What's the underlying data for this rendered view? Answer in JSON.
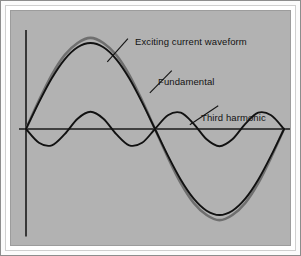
{
  "figure": {
    "background_color": "#b2b2b2",
    "mat_color": "#ffffff",
    "rule_color": "#8d8d8d",
    "curve_color_primary": "#111111",
    "curve_color_secondary": "#6f6f6f",
    "axis_color": "#1a1a1a"
  },
  "labels": {
    "exciting": "Exciting current waveform",
    "fundamental": "Fundamental",
    "third_harmonic": "Third harmonic"
  },
  "chart_data": {
    "type": "line",
    "title": "",
    "xlabel": "",
    "ylabel": "",
    "xlim": [
      0,
      2
    ],
    "ylim": [
      -1.35,
      1.35
    ],
    "grid": false,
    "legend": "annotated-leader-lines",
    "axes": {
      "vertical_axis_x": 0,
      "horizontal_axis_y": 0,
      "vertical_axis_drawn_range": [
        -1.25,
        1.15
      ],
      "horizontal_axis_drawn_range": [
        0,
        2.1
      ]
    },
    "annotations": [
      {
        "text": "Exciting current waveform",
        "target_series": "Exciting current waveform",
        "leader_from": [
          0.63,
          0.78
        ],
        "leader_to": [
          0.79,
          1.05
        ]
      },
      {
        "text": "Fundamental",
        "target_series": "Fundamental",
        "leader_from": [
          0.96,
          0.42
        ],
        "leader_to": [
          1.13,
          0.68
        ]
      },
      {
        "text": "Third harmonic",
        "target_series": "Third harmonic",
        "leader_from": [
          1.27,
          0.05
        ],
        "leader_to": [
          1.49,
          0.27
        ]
      }
    ],
    "series": [
      {
        "name": "Exciting current waveform",
        "color": "#6f6f6f",
        "description": "Peaky distorted magnetizing current: fundamental plus third harmonic, peaked and narrowed",
        "x": [
          0,
          0.1,
          0.2,
          0.3,
          0.4,
          0.5,
          0.6,
          0.7,
          0.8,
          0.9,
          1.0,
          1.1,
          1.2,
          1.3,
          1.4,
          1.5,
          1.6,
          1.7,
          1.8,
          1.9,
          2.0
        ],
        "values": [
          0,
          0.33,
          0.63,
          0.86,
          1.0,
          1.06,
          1.0,
          0.86,
          0.63,
          0.33,
          0,
          -0.33,
          -0.63,
          -0.86,
          -1.0,
          -1.06,
          -1.0,
          -0.86,
          -0.63,
          -0.33,
          0
        ]
      },
      {
        "name": "Fundamental",
        "color": "#111111",
        "description": "Pure sine wave, one full cycle",
        "x": [
          0,
          0.1,
          0.2,
          0.3,
          0.4,
          0.5,
          0.6,
          0.7,
          0.8,
          0.9,
          1.0,
          1.1,
          1.2,
          1.3,
          1.4,
          1.5,
          1.6,
          1.7,
          1.8,
          1.9,
          2.0
        ],
        "values": [
          0,
          0.31,
          0.59,
          0.81,
          0.95,
          1.0,
          0.95,
          0.81,
          0.59,
          0.31,
          0,
          -0.31,
          -0.59,
          -0.81,
          -0.95,
          -1.0,
          -0.95,
          -0.81,
          -0.59,
          -0.31,
          0
        ]
      },
      {
        "name": "Third harmonic",
        "color": "#111111",
        "description": "Third harmonic component, small amplitude, three cycles, inverted phase",
        "amplitude": 0.2,
        "cycles": 3,
        "x": [
          0,
          0.1,
          0.2,
          0.3,
          0.4,
          0.5,
          0.6,
          0.7,
          0.8,
          0.9,
          1.0,
          1.1,
          1.2,
          1.3,
          1.4,
          1.5,
          1.6,
          1.7,
          1.8,
          1.9,
          2.0
        ],
        "values": [
          0,
          -0.16,
          -0.19,
          -0.06,
          0.12,
          0.2,
          0.12,
          -0.06,
          -0.19,
          -0.16,
          0,
          0.16,
          0.19,
          0.06,
          -0.12,
          -0.2,
          -0.12,
          0.06,
          0.19,
          0.16,
          0
        ]
      }
    ]
  }
}
